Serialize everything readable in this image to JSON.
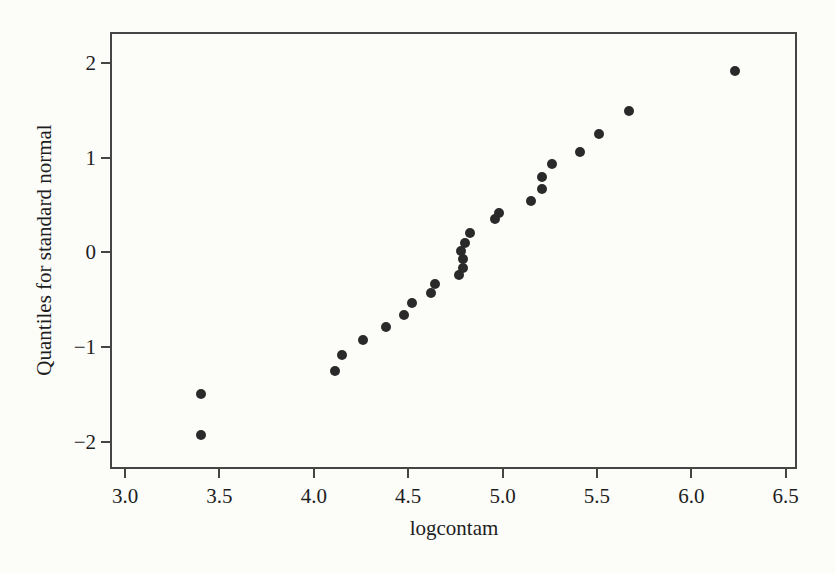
{
  "figure": {
    "background_color": "#fcfcf9",
    "frame_color": "#454545",
    "point_color": "#2a2a2a",
    "text_color": "#1e1e1e"
  },
  "chart_data": {
    "type": "scatter",
    "title": "",
    "xlabel": "logcontam",
    "ylabel": "Quantiles for standard normal",
    "xlim": [
      2.92,
      6.56
    ],
    "ylim": [
      -2.29,
      2.33
    ],
    "x_ticks": [
      3.0,
      3.5,
      4.0,
      4.5,
      5.0,
      5.5,
      6.0,
      6.5
    ],
    "x_tick_labels": [
      "3.0",
      "3.5",
      "4.0",
      "4.5",
      "5.0",
      "5.5",
      "6.0",
      "6.5"
    ],
    "y_ticks": [
      2,
      1,
      0,
      -1,
      -2
    ],
    "y_tick_labels": [
      "2",
      "1",
      "0",
      "−1",
      "−2"
    ],
    "grid": false,
    "legend": null,
    "marker": "filled-circle",
    "points": [
      [
        3.4,
        -1.93
      ],
      [
        3.4,
        -1.5
      ],
      [
        4.11,
        -1.25
      ],
      [
        4.15,
        -1.08
      ],
      [
        4.26,
        -0.93
      ],
      [
        4.38,
        -0.79
      ],
      [
        4.48,
        -0.66
      ],
      [
        4.52,
        -0.54
      ],
      [
        4.62,
        -0.43
      ],
      [
        4.64,
        -0.33
      ],
      [
        4.77,
        -0.24
      ],
      [
        4.79,
        -0.16
      ],
      [
        4.79,
        -0.07
      ],
      [
        4.78,
        0.02
      ],
      [
        4.8,
        0.1
      ],
      [
        4.83,
        0.21
      ],
      [
        4.96,
        0.35
      ],
      [
        4.98,
        0.42
      ],
      [
        5.15,
        0.54
      ],
      [
        5.21,
        0.67
      ],
      [
        5.21,
        0.8
      ],
      [
        5.26,
        0.93
      ],
      [
        5.41,
        1.06
      ],
      [
        5.51,
        1.25
      ],
      [
        5.67,
        1.5
      ],
      [
        6.23,
        1.92
      ]
    ]
  }
}
